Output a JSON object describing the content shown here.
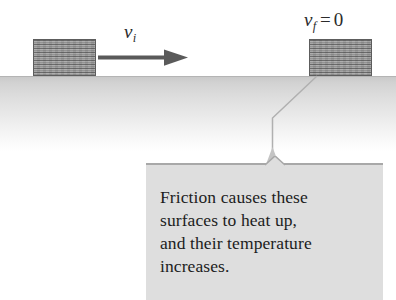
{
  "figure": {
    "type": "physics-diagram",
    "ground_label": "surface",
    "colors": {
      "block_fill": "#9a9a9a",
      "block_border": "#5d5d5d",
      "arrow": "#5a5a5a",
      "ground_top": "#c9c9c9",
      "callout_bg": "#dedede",
      "callout_edge": "#a8a8a8",
      "text": "#1c1c1c",
      "leader_line": "#b0b0b0"
    }
  },
  "labels": {
    "initial_velocity": {
      "symbol": "v",
      "subscript": "i",
      "full": "v_i"
    },
    "final_velocity": {
      "symbol": "v",
      "subscript": "f",
      "operator": "=",
      "value": "0",
      "full": "v_f = 0"
    }
  },
  "blocks": [
    {
      "name": "block-initial",
      "position": "left",
      "state": "moving"
    },
    {
      "name": "block-final",
      "position": "right",
      "state": "at-rest"
    }
  ],
  "arrow": {
    "name": "velocity-arrow",
    "direction": "right"
  },
  "callout": {
    "lines": [
      "Friction causes these",
      "surfaces to heat up,",
      "and their temperature",
      "increases."
    ],
    "full_text": "Friction causes these surfaces to heat up, and their temperature increases."
  }
}
